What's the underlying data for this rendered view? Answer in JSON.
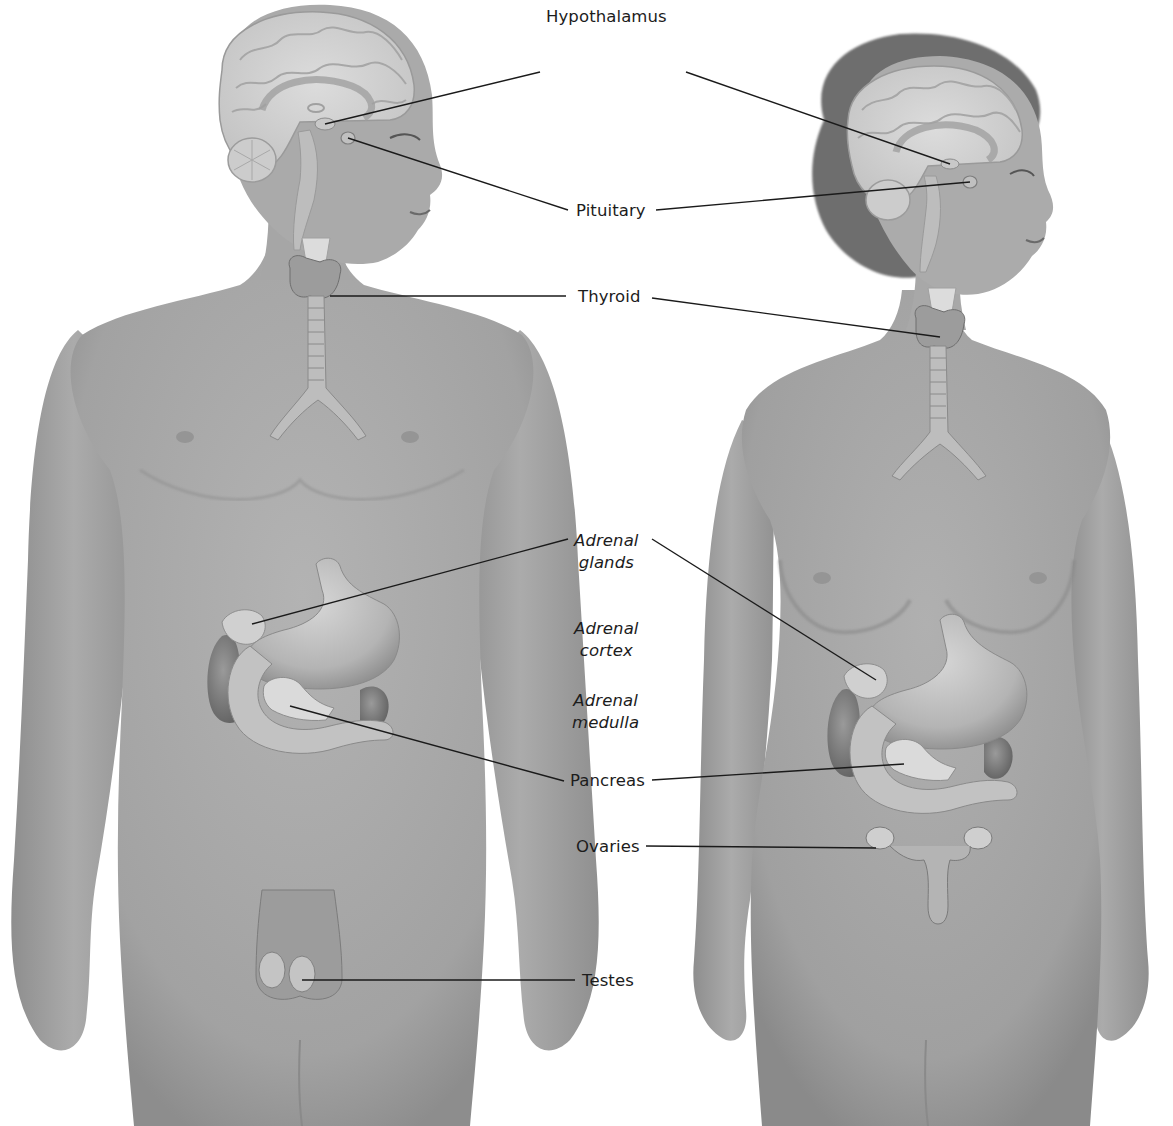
{
  "diagram": {
    "type": "anatomical-illustration",
    "figures": [
      {
        "id": "male",
        "position": "left",
        "facing": "right"
      },
      {
        "id": "female",
        "position": "right",
        "facing": "right"
      }
    ]
  },
  "labels": {
    "hypothalamus": "Hypothalamus",
    "pituitary": "Pituitary",
    "thyroid": "Thyroid",
    "adrenal_glands": {
      "line1": "Adrenal",
      "line2": "glands"
    },
    "adrenal_cortex": {
      "line1": "Adrenal",
      "line2": "cortex"
    },
    "adrenal_medulla": {
      "line1": "Adrenal",
      "line2": "medulla"
    },
    "pancreas": "Pancreas",
    "ovaries": "Ovaries",
    "testes": "Testes"
  },
  "leader_lines": [
    {
      "label": "Hypothalamus",
      "targets": [
        "male",
        "female"
      ]
    },
    {
      "label": "Pituitary",
      "targets": [
        "male",
        "female"
      ]
    },
    {
      "label": "Thyroid",
      "targets": [
        "male",
        "female"
      ]
    },
    {
      "label": "Adrenal glands",
      "targets": [
        "male",
        "female"
      ]
    },
    {
      "label": "Pancreas",
      "targets": [
        "male",
        "female"
      ]
    },
    {
      "label": "Ovaries",
      "targets": [
        "female"
      ]
    },
    {
      "label": "Testes",
      "targets": [
        "male"
      ]
    }
  ],
  "colors": {
    "background": "#ffffff",
    "skin": "#a9a9a9",
    "skin_shadow": "#8f8f8f",
    "brain": "#d2d2d2",
    "organ": "#bdbdbd",
    "organ_dark": "#7a7a7a",
    "hair": "#6e6e6e",
    "line": "#1a1a1a",
    "text": "#1c1c1c"
  }
}
